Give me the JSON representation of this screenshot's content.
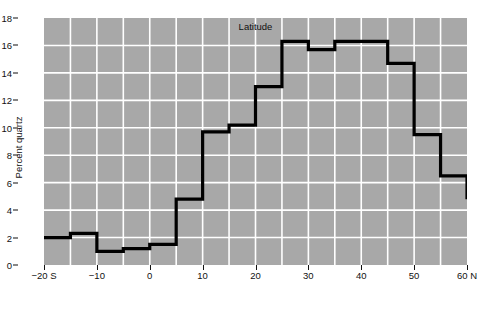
{
  "chart_data": {
    "type": "line",
    "subtype": "step-post",
    "title": "",
    "xlabel": "Latitude",
    "ylabel": "Percent quartz",
    "xlim": [
      -20,
      60
    ],
    "ylim": [
      0,
      18
    ],
    "grid": true,
    "legend": null,
    "background_color": "#a8a8a8",
    "gridline_color": "#ffffff",
    "series_color": "#000000",
    "x_tick_labels": [
      "−20 S",
      "−10",
      "0",
      "10",
      "20",
      "30",
      "40",
      "50",
      "60 N"
    ],
    "x_ticks": [
      -20,
      -10,
      0,
      10,
      20,
      30,
      40,
      50,
      60
    ],
    "y_ticks": [
      0,
      2,
      4,
      6,
      8,
      10,
      12,
      14,
      16,
      18
    ],
    "y_tick_labels": [
      "0",
      "2",
      "4",
      "6",
      "8",
      "10",
      "12",
      "14",
      "16",
      "18"
    ],
    "x_minor_gridlines": [
      -15,
      -5,
      5,
      15,
      25,
      35,
      45,
      55
    ],
    "bin_width": 5,
    "bin_edges": [
      -20,
      -15,
      -10,
      -5,
      0,
      5,
      10,
      15,
      20,
      25,
      30,
      35,
      40,
      45,
      50,
      55,
      60
    ],
    "values": [
      2.0,
      2.3,
      1.0,
      1.2,
      1.5,
      4.8,
      9.7,
      10.2,
      13.0,
      16.3,
      15.7,
      16.3,
      16.3,
      14.7,
      9.5,
      6.5,
      4.8
    ],
    "points": [
      {
        "x": -20,
        "y": 2.0
      },
      {
        "x": -15,
        "y": 2.3
      },
      {
        "x": -10,
        "y": 1.0
      },
      {
        "x": -5,
        "y": 1.2
      },
      {
        "x": 0,
        "y": 1.5
      },
      {
        "x": 5,
        "y": 4.8
      },
      {
        "x": 10,
        "y": 9.7
      },
      {
        "x": 15,
        "y": 10.2
      },
      {
        "x": 20,
        "y": 13.0
      },
      {
        "x": 25,
        "y": 16.3
      },
      {
        "x": 30,
        "y": 15.7
      },
      {
        "x": 35,
        "y": 16.3
      },
      {
        "x": 40,
        "y": 16.3
      },
      {
        "x": 45,
        "y": 14.7
      },
      {
        "x": 50,
        "y": 9.5
      },
      {
        "x": 55,
        "y": 6.5
      },
      {
        "x": 60,
        "y": 4.8
      }
    ]
  }
}
